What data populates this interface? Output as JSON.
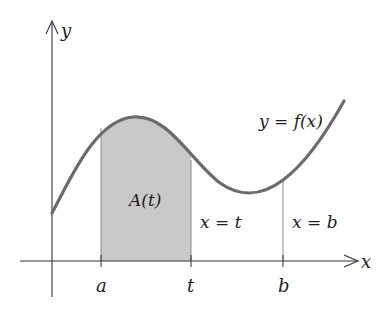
{
  "diagram": {
    "labels": {
      "y_axis": "y",
      "x_axis": "x",
      "curve": "y = f(x)",
      "area": "A(t)",
      "line_t": "x = t",
      "line_b": "x = b",
      "tick_a": "a",
      "tick_t": "t",
      "tick_b": "b"
    },
    "colors": {
      "curve": "#6b6b6b",
      "shade": "#c9c9c9",
      "axis": "#333333",
      "text": "#222222"
    }
  }
}
